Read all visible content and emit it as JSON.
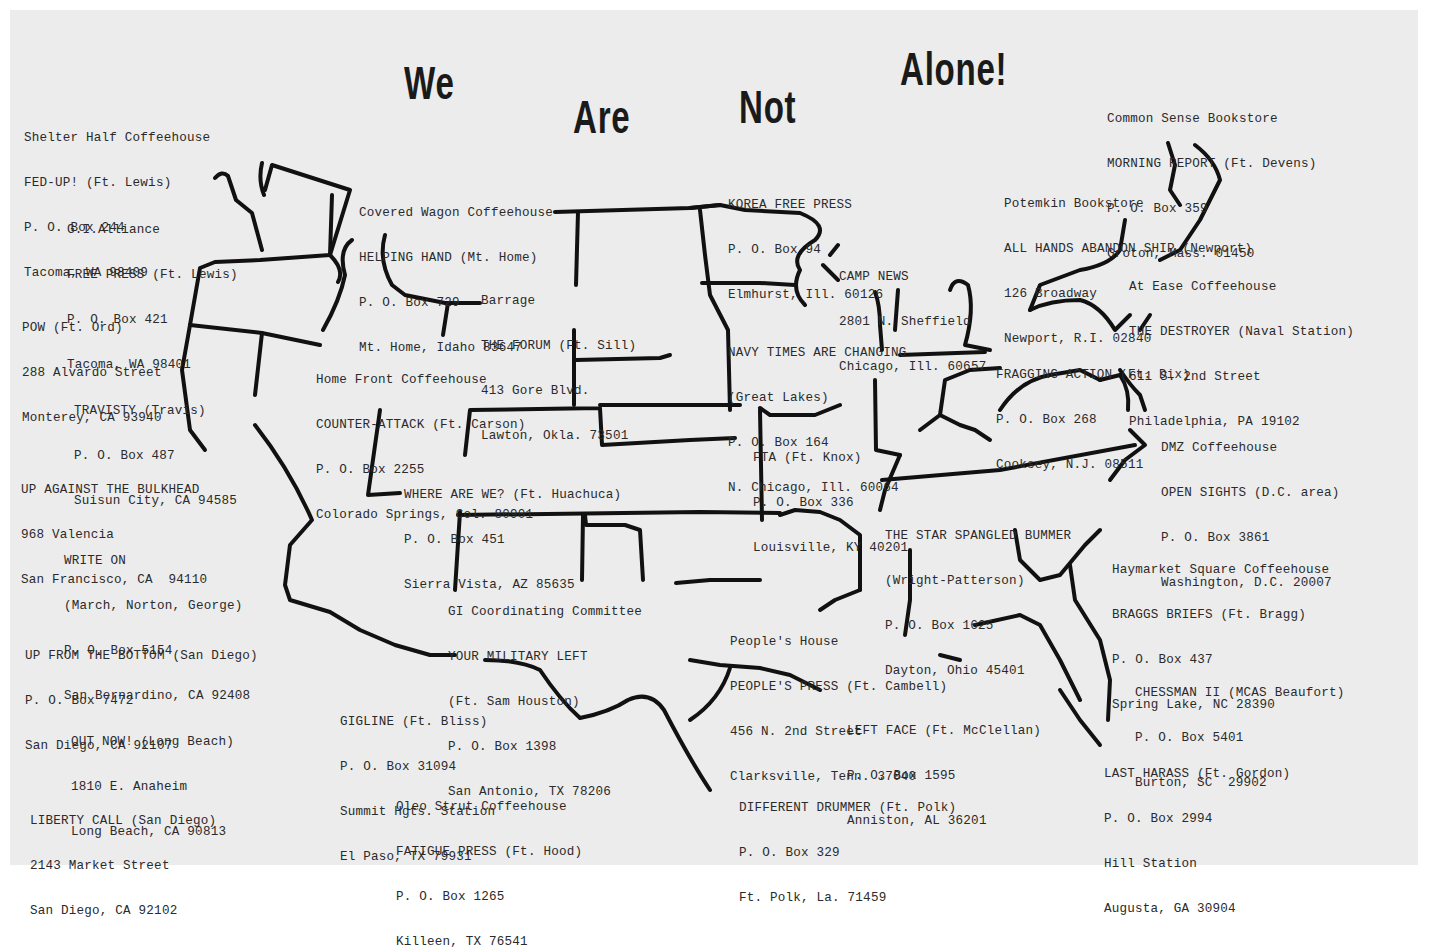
{
  "title": {
    "words": [
      "We",
      "Are",
      "Not",
      "Alone!"
    ]
  },
  "entries": [
    {
      "id": "shelter-half",
      "lines": [
        "Shelter Half Coffeehouse",
        "FED-UP! (Ft. Lewis)",
        "P. O. Box 244",
        "Tacoma, WA 98409"
      ]
    },
    {
      "id": "gi-alliance",
      "lines": [
        "G.I.Alliance",
        "FREE PRESS (Ft. Lewis)",
        "P. O. Box 421",
        "Tacoma, WA 98401"
      ]
    },
    {
      "id": "pow",
      "lines": [
        "POW (Ft. Ord)",
        "288 Alvardo Street",
        "Monterey, CA 93940"
      ]
    },
    {
      "id": "travisty",
      "lines": [
        "TRAVISTY (Travis)",
        "P. O. Box 487",
        "Suisun City, CA 94585"
      ]
    },
    {
      "id": "up-against",
      "lines": [
        "UP AGAINST THE BULKHEAD",
        "968 Valencia",
        "San Francisco, CA  94110"
      ]
    },
    {
      "id": "write-on",
      "lines": [
        "WRITE ON",
        "(March, Norton, George)",
        "P. O. Box 5154",
        "San Bernardino, CA 92408"
      ]
    },
    {
      "id": "up-from-bottom",
      "lines": [
        "UP FROM THE BOTTOM (San Diego)",
        "P. O. Box 7472",
        "San Diego, CA 92107"
      ]
    },
    {
      "id": "out-now",
      "lines": [
        "OUT NOW! (Long Beach)",
        "1810 E. Anaheim",
        "Long Beach, CA 90813"
      ]
    },
    {
      "id": "liberty-call",
      "lines": [
        "LIBERTY CALL (San Diego)",
        "2143 Market Street",
        "San Diego, CA 92102"
      ]
    },
    {
      "id": "covered-wagon",
      "lines": [
        "Covered Wagon Coffeehouse",
        "HELPING HAND (Mt. Home)",
        "P. O. Box 729",
        "Mt. Home, Idaho 83647"
      ]
    },
    {
      "id": "barrage",
      "lines": [
        "Barrage",
        "THE FORUM (Ft. Sill)",
        "413 Gore Blvd.",
        "Lawton, Okla. 73501"
      ]
    },
    {
      "id": "home-front",
      "lines": [
        "Home Front Coffeehouse",
        "COUNTER-ATTACK (Ft. Carson)",
        "P. O. Box 2255",
        "Colorado Springs, Col. 80901"
      ]
    },
    {
      "id": "where-are-we",
      "lines": [
        "WHERE ARE WE? (Ft. Huachuca)",
        "P. O. Box 451",
        "Sierra Vista, AZ 85635"
      ]
    },
    {
      "id": "gi-coordinating",
      "lines": [
        "GI Coordinating Committee",
        "YOUR MILITARY LEFT",
        "(Ft. Sam Houston)",
        "P. O. Box 1398",
        "San Antonio, TX 78206"
      ]
    },
    {
      "id": "gigline",
      "lines": [
        "GIGLINE (Ft. Bliss)",
        "P. O. Box 31094",
        "Summit Hgts. Station",
        "El Paso, TX 79931"
      ]
    },
    {
      "id": "oleo-strut",
      "lines": [
        "Oleo Strut Coffeehouse",
        "FATIGUE PRESS (Ft. Hood)",
        "P. O. Box 1265",
        "Killeen, TX 76541"
      ]
    },
    {
      "id": "korea-free-press",
      "lines": [
        "KOREA FREE PRESS",
        "P. O. Box 94",
        "Elmhurst, Ill. 60126"
      ]
    },
    {
      "id": "camp-news",
      "lines": [
        "CAMP NEWS",
        "2801 N. Sheffield",
        "Chicago, Ill. 60657"
      ]
    },
    {
      "id": "navy-times",
      "lines": [
        "NAVY TIMES ARE CHANGING",
        "(Great Lakes)",
        "P. O. Box 164",
        "N. Chicago, Ill. 60064"
      ]
    },
    {
      "id": "fta",
      "lines": [
        "FTA (Ft. Knox)",
        "P. O. Box 336",
        "Louisville, KY 40201"
      ]
    },
    {
      "id": "star-spangled",
      "lines": [
        "THE STAR SPANGLED BUMMER",
        "(Wright-Patterson)",
        "P. O. Box 1625",
        "Dayton, Ohio 45401"
      ]
    },
    {
      "id": "peoples-house",
      "lines": [
        "People's House",
        "PEOPLE'S PRESS (Ft. Cambell)",
        "456 N. 2nd Street",
        "Clarksville, Tenn. 37040"
      ]
    },
    {
      "id": "left-face",
      "lines": [
        "LEFT FACE (Ft. McClellan)",
        "P. O. Box 1595",
        "Anniston, AL 36201"
      ]
    },
    {
      "id": "different-drummer",
      "lines": [
        "DIFFERENT DRUMMER (Ft. Polk)",
        "P. O. Box 329",
        "Ft. Polk, La. 71459"
      ]
    },
    {
      "id": "common-sense",
      "lines": [
        "Common Sense Bookstore",
        "MORNING REPORT (Ft. Devens)",
        "P. O. Box 359",
        "Groton, Mass. 01450"
      ]
    },
    {
      "id": "potemkin",
      "lines": [
        "Potemkin Bookstore",
        "ALL HANDS ABANDON SHIP (Newport)",
        "126 Broadway",
        "Newport, R.I. 02840"
      ]
    },
    {
      "id": "at-ease",
      "lines": [
        "At Ease Coffeehouse",
        "THE DESTROYER (Naval Station)",
        "611 S. 2nd Street",
        "Philadelphia, PA 19102"
      ]
    },
    {
      "id": "fragging-action",
      "lines": [
        "FRAGGING ACTION (Ft. Dix)",
        "P. O. Box 268",
        "Cooksey, N.J. 08511"
      ]
    },
    {
      "id": "dmz",
      "lines": [
        "DMZ Coffeehouse",
        "OPEN SIGHTS (D.C. area)",
        "P. O. Box 3861",
        "Washington, D.C. 20007"
      ]
    },
    {
      "id": "haymarket",
      "lines": [
        "Haymarket Square Coffeehouse",
        "BRAGGS BRIEFS (Ft. Bragg)",
        "P. O. Box 437",
        "Spring Lake, NC 28390"
      ]
    },
    {
      "id": "chessman",
      "lines": [
        "CHESSMAN II (MCAS Beaufort)",
        "P. O. Box 5401",
        "Burton, SC  29902"
      ]
    },
    {
      "id": "last-harass",
      "lines": [
        "LAST HARASS (Ft. Gordon)",
        "P. O. Box 2994",
        "Hill Station",
        "Augusta, GA 30904"
      ]
    }
  ]
}
